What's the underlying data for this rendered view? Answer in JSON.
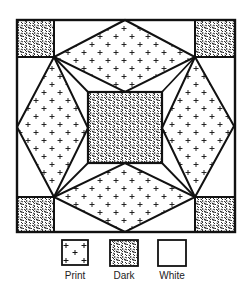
{
  "diagram": {
    "type": "quilt-block-pattern",
    "colors": {
      "line": "#111111",
      "background": "#ffffff",
      "dark_fill": "#3a3a3a"
    },
    "block": {
      "outer_frame": {
        "x": 17,
        "y": 20,
        "w": 218,
        "h": 212
      },
      "corner_squares": [
        {
          "id": "top-left",
          "fabric": "Dark"
        },
        {
          "id": "top-right",
          "fabric": "Dark"
        },
        {
          "id": "bottom-left",
          "fabric": "Dark"
        },
        {
          "id": "bottom-right",
          "fabric": "Dark"
        }
      ],
      "center_square": {
        "fabric": "Dark"
      },
      "kites": [
        {
          "id": "top",
          "fabric": "Print"
        },
        {
          "id": "right",
          "fabric": "Print"
        },
        {
          "id": "bottom",
          "fabric": "Print"
        },
        {
          "id": "left",
          "fabric": "Print"
        }
      ],
      "background_triangles": {
        "fabric": "White"
      }
    },
    "legend": [
      {
        "label": "Print",
        "swatch": "print"
      },
      {
        "label": "Dark",
        "swatch": "dark"
      },
      {
        "label": "White",
        "swatch": "white"
      }
    ]
  }
}
